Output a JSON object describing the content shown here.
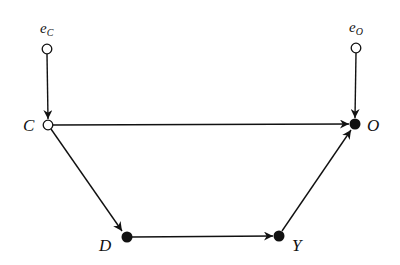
{
  "diagram": {
    "type": "directed-acyclic-graph",
    "nodes": [
      {
        "id": "eC",
        "label": "e",
        "subscript": "C",
        "x": 47,
        "y": 49,
        "filled": false
      },
      {
        "id": "C",
        "label": "C",
        "x": 48,
        "y": 125,
        "filled": false
      },
      {
        "id": "eO",
        "label": "e",
        "subscript": "O",
        "x": 356,
        "y": 48,
        "filled": false
      },
      {
        "id": "O",
        "label": "O",
        "x": 355,
        "y": 124,
        "filled": true
      },
      {
        "id": "D",
        "label": "D",
        "x": 127,
        "y": 237,
        "filled": true
      },
      {
        "id": "Y",
        "label": "Y",
        "x": 279,
        "y": 236,
        "filled": true
      }
    ],
    "edges": [
      {
        "from": "eC",
        "to": "C"
      },
      {
        "from": "eO",
        "to": "O"
      },
      {
        "from": "C",
        "to": "O"
      },
      {
        "from": "C",
        "to": "D"
      },
      {
        "from": "D",
        "to": "Y"
      },
      {
        "from": "Y",
        "to": "O"
      }
    ],
    "labels": {
      "eC": {
        "main": "e",
        "sub": "C"
      },
      "eO": {
        "main": "e",
        "sub": "O"
      },
      "C": "C",
      "O": "O",
      "D": "D",
      "Y": "Y"
    },
    "colors": {
      "stroke": "#111111",
      "background": "#ffffff"
    }
  }
}
